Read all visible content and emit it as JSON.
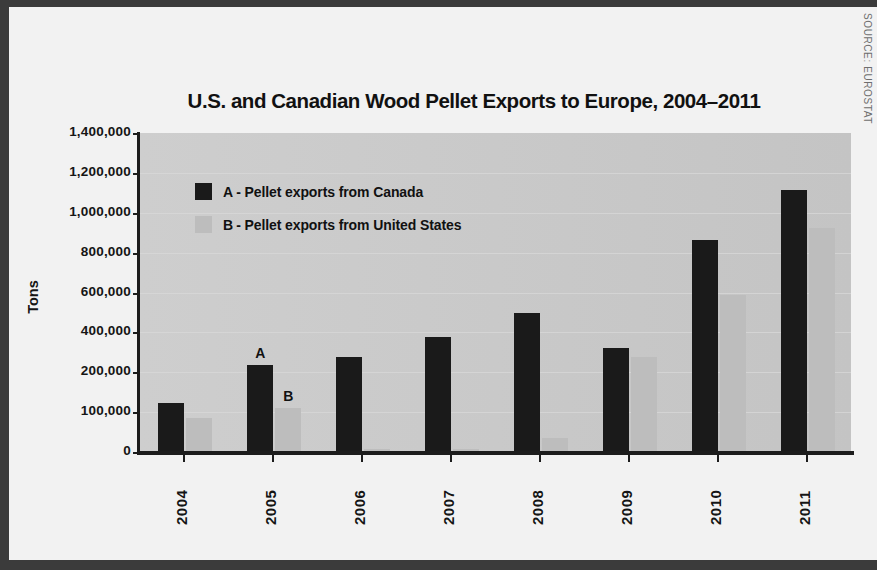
{
  "figure": {
    "title": "U.S. and Canadian Wood Pellet Exports to Europe, 2004–2011",
    "source": "SOURCE: EUROSTAT",
    "background_color": "#f2f2f2",
    "frame_color": "#3b3b3b",
    "plot_background_color": "#c9c9c9"
  },
  "legend": {
    "position": "inside-top-left",
    "entries": [
      {
        "key": "A",
        "separator": "-",
        "label": "Pellet exports from Canada",
        "swatch_color": "#1a1a1a"
      },
      {
        "key": "B",
        "separator": "-",
        "label": "Pellet exports from United States",
        "swatch_color": "#bdbdbd"
      }
    ]
  },
  "annotations": [
    {
      "text": "A",
      "x_year": "2005",
      "series": "A"
    },
    {
      "text": "B",
      "x_year": "2005",
      "series": "B"
    }
  ],
  "chart_data": {
    "type": "bar",
    "title": "U.S. and Canadian Wood Pellet Exports to Europe, 2004–2011",
    "xlabel": "",
    "ylabel": "Tons",
    "categories": [
      "2004",
      "2005",
      "2006",
      "2007",
      "2008",
      "2009",
      "2010",
      "2011"
    ],
    "series": [
      {
        "name": "Pellet exports from Canada",
        "key": "A",
        "color": "#1a1a1a",
        "values": [
          215000,
          380000,
          415000,
          505000,
          610000,
          455000,
          930000,
          1150000
        ]
      },
      {
        "name": "Pellet exports from United States",
        "key": "B",
        "color": "#bdbdbd",
        "values": [
          150000,
          195000,
          15000,
          13000,
          60000,
          415000,
          690000,
          985000
        ]
      }
    ],
    "ylim": [
      0,
      1400000
    ],
    "yticks": [
      0,
      100000,
      200000,
      400000,
      600000,
      800000,
      1000000,
      1200000,
      1400000
    ],
    "ytick_labels": [
      "0",
      "100,000",
      "200,000",
      "400,000",
      "600,000",
      "800,000",
      "1,000,000",
      "1,200,000",
      "1,400,000"
    ],
    "grid": true,
    "legend_position": "upper left",
    "units": "Tons"
  }
}
